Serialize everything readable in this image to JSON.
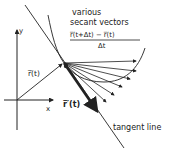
{
  "diagram": {
    "title_lines": [
      "various",
      "secant vectors"
    ],
    "formula": {
      "numerator": "r̅(t+Δt) − r̅(t)",
      "denominator": "Δt"
    },
    "labels": {
      "y_axis": "y",
      "x_axis": "x",
      "position_vector": "r̅(t)",
      "derivative_vector": "r̅′(t)",
      "tangent_line": "tangent line"
    },
    "colors": {
      "ink": "#222222",
      "background": "#ffffff"
    }
  }
}
